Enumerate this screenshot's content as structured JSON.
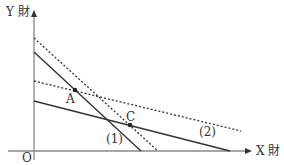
{
  "diagram": {
    "type": "economics budget-line / indifference diagram",
    "axes": {
      "y_label": "Y 財",
      "x_label": "X 財",
      "origin_label": "O"
    },
    "points": [
      {
        "label": "A"
      },
      {
        "label": "C"
      }
    ],
    "line_labels": {
      "line1": "(1)",
      "line2": "(2)"
    },
    "colors": {
      "line": "#333333",
      "axis": "#888888",
      "background": "#ffffff"
    }
  }
}
